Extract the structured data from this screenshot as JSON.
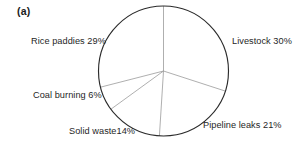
{
  "figure": {
    "panel_label": "(a)"
  },
  "chart_data": {
    "type": "pie",
    "title": "",
    "subtitle": "",
    "xlabel": "",
    "ylabel": "",
    "grid": false,
    "legend_position": "none",
    "label_format": "name + percent",
    "start_angle_deg": 0,
    "direction": "clockwise",
    "categories": [
      "Livestock",
      "Pipeline leaks",
      "Solid waste",
      "Coal burning",
      "Rice paddies"
    ],
    "values": [
      30,
      21,
      14,
      6,
      29
    ],
    "unit": "%",
    "labels": [
      "Livestock 30%",
      "Pipeline leaks 21%",
      "Solid waste14%",
      "Coal burning 6%",
      "Rice paddies 29%"
    ],
    "slices": [
      {
        "name": "Livestock",
        "value": 30,
        "label": "Livestock 30%",
        "start_deg": 0,
        "end_deg": 108,
        "fill": "#ffffff",
        "stroke": "#8c8c8c"
      },
      {
        "name": "Pipeline leaks",
        "value": 21,
        "label": "Pipeline leaks 21%",
        "start_deg": 108,
        "end_deg": 183.6,
        "fill": "#ffffff",
        "stroke": "#8c8c8c"
      },
      {
        "name": "Solid waste",
        "value": 14,
        "label": "Solid waste14%",
        "start_deg": 183.6,
        "end_deg": 234,
        "fill": "#ffffff",
        "stroke": "#8c8c8c"
      },
      {
        "name": "Coal burning",
        "value": 6,
        "label": "Coal burning 6%",
        "start_deg": 234,
        "end_deg": 255.6,
        "fill": "#ffffff",
        "stroke": "#8c8c8c"
      },
      {
        "name": "Rice paddies",
        "value": 29,
        "label": "Rice paddies 29%",
        "start_deg": 255.6,
        "end_deg": 360,
        "fill": "#ffffff",
        "stroke": "#8c8c8c"
      }
    ],
    "colors": {
      "outline": "#2b2b2b",
      "divider": "#9a9a9a",
      "text": "#262626",
      "background": "#ffffff"
    },
    "geometry": {
      "center_x": 163.5,
      "center_y": 71,
      "radius": 65
    }
  }
}
